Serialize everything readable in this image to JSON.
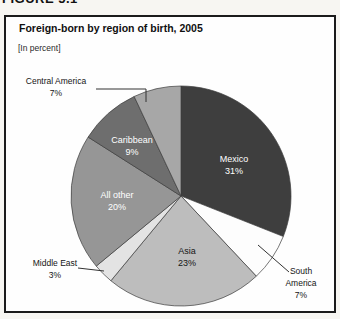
{
  "figure_label": "FIGURE 5.1",
  "chart_data": {
    "type": "pie",
    "title": "Foreign-born by region of birth, 2005",
    "subtitle": "[In percent]",
    "value_unit": "%",
    "direction": "clockwise",
    "start_position": "12 o'clock",
    "total": 100,
    "colors": {
      "outline": "#3c3c3c",
      "leader_line": "#333333",
      "box_border": "#1b1b1b",
      "background": "#fefefe"
    },
    "slices": [
      {
        "label": "Mexico",
        "value": 31,
        "pct_text": "31%",
        "color": "#3e3e3e",
        "label_color": "#ffffff",
        "label_placement": "inside"
      },
      {
        "label": "South America",
        "value": 7,
        "pct_text": "7%",
        "color": "#fdfdfd",
        "label_color": "#151515",
        "label_placement": "outside"
      },
      {
        "label": "Asia",
        "value": 23,
        "pct_text": "23%",
        "color": "#bdbdbd",
        "label_color": "#151515",
        "label_placement": "inside"
      },
      {
        "label": "Middle East",
        "value": 3,
        "pct_text": "3%",
        "color": "#e3e3e3",
        "label_color": "#151515",
        "label_placement": "outside"
      },
      {
        "label": "All other",
        "value": 20,
        "pct_text": "20%",
        "color": "#969696",
        "label_color": "#ffffff",
        "label_placement": "inside"
      },
      {
        "label": "Caribbean",
        "value": 9,
        "pct_text": "9%",
        "color": "#6e6e6e",
        "label_color": "#ffffff",
        "label_placement": "inside"
      },
      {
        "label": "Central America",
        "value": 7,
        "pct_text": "7%",
        "color": "#a7a7a7",
        "label_color": "#151515",
        "label_placement": "outside"
      }
    ]
  }
}
